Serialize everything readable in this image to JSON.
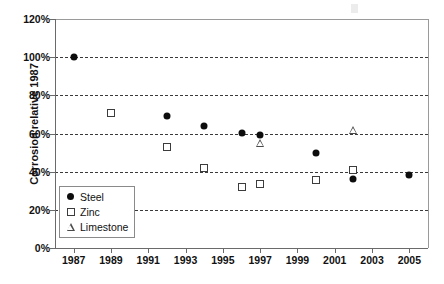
{
  "chart_data": {
    "type": "scatter",
    "title": "",
    "subtitle": "",
    "xlabel": "",
    "ylabel": "Corrosion relative 1987",
    "xlim": [
      1986,
      2006
    ],
    "ylim": [
      0,
      120
    ],
    "y_unit": "%",
    "grid": true,
    "grid_axis": "y",
    "grid_style": "dashed",
    "legend_position": "inside-bottom-left",
    "x_ticks": [
      1987,
      1989,
      1991,
      1993,
      1995,
      1997,
      1999,
      2001,
      2003,
      2005
    ],
    "x_tick_labels": [
      "1987",
      "1989",
      "1991",
      "1993",
      "1995",
      "1997",
      "1999",
      "2001",
      "2003",
      "2005"
    ],
    "y_ticks": [
      0,
      20,
      40,
      60,
      80,
      100,
      120
    ],
    "y_tick_labels": [
      "0%",
      "20%",
      "40%",
      "60%",
      "80%",
      "100%",
      "120%"
    ],
    "series": [
      {
        "name": "Steel",
        "marker": "filled-circle",
        "color": "#0d0d0d",
        "points": [
          {
            "x": 1987,
            "y": 100
          },
          {
            "x": 1992,
            "y": 69
          },
          {
            "x": 1994,
            "y": 64
          },
          {
            "x": 1996,
            "y": 60.5
          },
          {
            "x": 1997,
            "y": 59
          },
          {
            "x": 2000,
            "y": 50
          },
          {
            "x": 2002,
            "y": 36
          },
          {
            "x": 2005,
            "y": 38
          }
        ]
      },
      {
        "name": "Zinc",
        "marker": "open-square",
        "color": "#3c3c3c",
        "points": [
          {
            "x": 1989,
            "y": 71
          },
          {
            "x": 1992,
            "y": 53
          },
          {
            "x": 1994,
            "y": 42
          },
          {
            "x": 1996,
            "y": 32
          },
          {
            "x": 1997,
            "y": 33.5
          },
          {
            "x": 2000,
            "y": 35.5
          },
          {
            "x": 2002,
            "y": 41
          }
        ]
      },
      {
        "name": "Limestone",
        "marker": "open-triangle",
        "color": "#4a4a4a",
        "points": [
          {
            "x": 1997,
            "y": 55
          },
          {
            "x": 2002,
            "y": 62
          }
        ]
      }
    ]
  },
  "axes": {
    "y_title": "Corrosion relative 1987"
  },
  "legend": {
    "entries": [
      {
        "label": "Steel",
        "marker": "filled-circle"
      },
      {
        "label": "Zinc",
        "marker": "open-square"
      },
      {
        "label": "Limestone",
        "marker": "open-triangle"
      }
    ]
  }
}
